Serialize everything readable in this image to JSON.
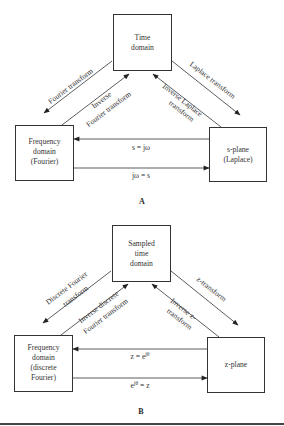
{
  "diagram_a": {
    "label": "A",
    "nodes": {
      "top": {
        "line1": "Time",
        "line2": "domain"
      },
      "left": {
        "line1": "Frequency",
        "line2": "domain",
        "line3": "(Fourier)"
      },
      "right": {
        "line1": "s-plane",
        "line2": "(Laplace)"
      }
    },
    "edges": {
      "top_to_left": "Fourier transform",
      "left_to_top_line1": "Inverse",
      "left_to_top_line2": "Fourier transform",
      "top_to_right": "Laplace transform",
      "right_to_top_line1": "Inverse Laplace",
      "right_to_top_line2": "transform",
      "right_to_left": "s = jω",
      "left_to_right": "jω = s"
    }
  },
  "diagram_b": {
    "label": "B",
    "nodes": {
      "top": {
        "line1": "Sampled",
        "line2": "time",
        "line3": "domain"
      },
      "left": {
        "line1": "Frequency",
        "line2": "domain",
        "line3": "(discrete",
        "line4": "Fourier)"
      },
      "right": {
        "line1": "z-plane"
      }
    },
    "edges": {
      "top_to_left_line1": "Discrete Fourier",
      "top_to_left_line2": "transform",
      "left_to_top_line1": "Inverse discrete",
      "left_to_top_line2": "Fourier transform",
      "top_to_right": "z-transform",
      "right_to_top_line1": "Inverse z-",
      "right_to_top_line2": "transform",
      "right_to_left_base": "z = e",
      "right_to_left_sup": "jθ",
      "left_to_right_base": "e",
      "left_to_right_sup": "jθ",
      "left_to_right_tail": " = z"
    }
  }
}
